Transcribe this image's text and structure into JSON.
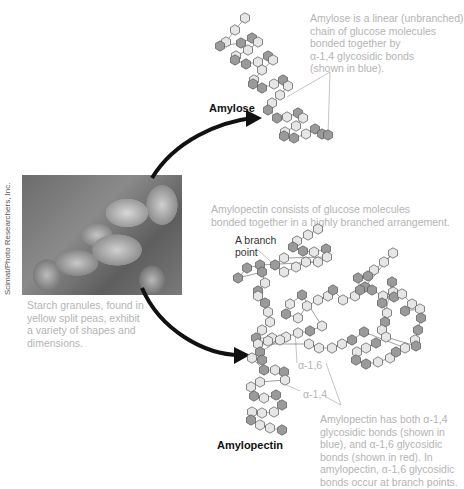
{
  "amylose": {
    "label": "Amylose",
    "description": "Amylose is a linear (unbranched)\nchain of glucose molecules\nbonded together by\nα-1,4 glycosidic bonds\n(shown in blue)."
  },
  "amylopectin": {
    "label": "Amylopectin",
    "description": "Amylopectin consists of glucose molecules\nbonded together in a highly branched arrangement.",
    "branch_point_label": "A branch\npoint",
    "bond_a16_label": "α-1,6",
    "bond_a14_label": "α-1,4",
    "bonds_note": "Amylopectin has both α-1,4\nglycosidic bonds (shown in\nblue), and α-1,6 glycosidic\nbonds (shown in red). In\namylopectin, α-1,6 glycosidic\nbonds occur at branch points."
  },
  "photo": {
    "caption": "Starch granules, found in\nyellow split peas, exhibit\na variety of shapes and\ndimensions.",
    "credit": "Scimat/Photo Researchers, Inc."
  },
  "colors": {
    "hex_light": "#e6e6e6",
    "hex_dark": "#9a9a9a",
    "hex_stroke": "#555555",
    "text_gray": "#b4b4b4",
    "arrow": "#111111"
  }
}
